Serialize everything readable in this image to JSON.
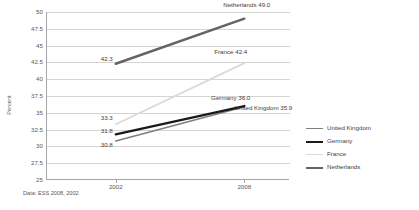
{
  "chart_data": {
    "type": "line",
    "title": "",
    "xlabel": "",
    "ylabel": "Percent",
    "x": [
      "2002",
      "2008"
    ],
    "xlim": [
      2002,
      2008
    ],
    "ylim": [
      25,
      50
    ],
    "yticks": [
      "50",
      "47.5",
      "45",
      "42.5",
      "40",
      "37.5",
      "35",
      "32.5",
      "30",
      "27.5",
      "25"
    ],
    "ytick_values": [
      50,
      47.5,
      45,
      42.5,
      40,
      37.5,
      35,
      32.5,
      30,
      27.5,
      25
    ],
    "grid": "horizontal",
    "legend_position": "right",
    "series": [
      {
        "name": "United Kingdom",
        "color": "#7f7f7f",
        "width": 1.6,
        "values": [
          30.8,
          35.9
        ],
        "start_label": "30.8",
        "end_label": "United Kingdom 35.9"
      },
      {
        "name": "Germany",
        "color": "#1a1a1a",
        "width": 2.4,
        "values": [
          31.8,
          36.0
        ],
        "start_label": "31.8",
        "end_label": "Germany 36.0"
      },
      {
        "name": "France",
        "color": "#d9d9d9",
        "width": 1.8,
        "values": [
          33.3,
          42.4
        ],
        "start_label": "33.3",
        "end_label": "France 42.4"
      },
      {
        "name": "Netherlands",
        "color": "#646464",
        "width": 2.4,
        "values": [
          42.3,
          49.0
        ],
        "start_label": "42.3",
        "end_label": "Netherlands 49.0"
      }
    ],
    "annotations": [
      {
        "text": "42.3",
        "series": "Netherlands",
        "point": "2002"
      },
      {
        "text": "Netherlands  49.0",
        "series": "Netherlands",
        "point": "2008"
      },
      {
        "text": "France 42.4",
        "series": "France",
        "point": "2008"
      },
      {
        "text": "33.3",
        "series": "France",
        "point": "2002"
      },
      {
        "text": "Germany 36.0",
        "series": "Germany",
        "point": "2008"
      },
      {
        "text": "31.8",
        "series": "Germany",
        "point": "2002"
      },
      {
        "text": "United Kingdom 35.9",
        "series": "United Kingdom",
        "point": "2008"
      },
      {
        "text": "30.8",
        "series": "United Kingdom",
        "point": "2002"
      }
    ],
    "source_note": "Data: ESS 2008, 2002"
  },
  "legend": {
    "items": [
      {
        "label": "United Kingdom"
      },
      {
        "label": "Germany"
      },
      {
        "label": "France"
      },
      {
        "label": "Netherlands"
      }
    ]
  },
  "axis": {
    "y_title": "Percent",
    "y_ticks": [
      "50",
      "47.5",
      "45",
      "42.5",
      "40",
      "37.5",
      "35",
      "32.5",
      "30",
      "27.5",
      "25"
    ],
    "x_ticks": [
      "2002",
      "2008"
    ]
  },
  "labels": {
    "netherlands_2002": "42.3",
    "netherlands_2008": "Netherlands  49.0",
    "france_2002": "33.3",
    "france_2008": "France 42.4",
    "germany_2002": "31.8",
    "germany_2008": "Germany 36.0",
    "uk_2002": "30.8",
    "uk_2008": "United Kingdom 35.9"
  },
  "footer": {
    "source": "Data: ESS 2008, 2002"
  }
}
